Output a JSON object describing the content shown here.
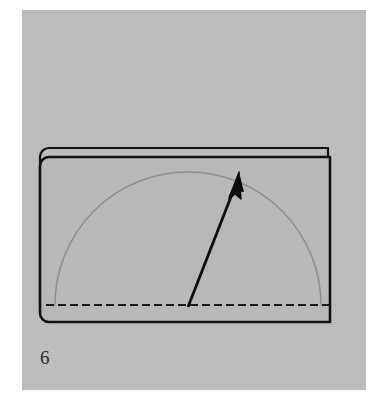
{
  "figure": {
    "step_number": "6",
    "caption": "",
    "panel_background_color": "#bdbdbd",
    "page_background_color": "#ffffff"
  },
  "colors": {
    "panel_gray": "#bdbdbd",
    "paper_fill": "#b8b8b8",
    "paper_fill_back": "#bcbcbc",
    "edge_black": "#111111",
    "fold_line_black": "#1a1a1a",
    "arc_gray": "#8f8f8f",
    "arrow_black": "#0d0d0d",
    "white_margin": "#ffffff"
  },
  "model": {
    "name": "folded-paper-two-layers",
    "back_layer": {
      "label": "back-layer",
      "x": 40,
      "y": 148,
      "width": 288,
      "height": 164,
      "corner_radius_top_left": 9,
      "corner_radius_bottom_left": 9,
      "stroke_width": 2.2
    },
    "front_layer": {
      "label": "front-layer",
      "x": 40,
      "y": 157,
      "width": 290,
      "height": 165,
      "corner_radius_top_left": 9,
      "corner_radius_bottom_left": 9,
      "stroke_width": 2.6
    }
  },
  "annotations": {
    "fold_line": {
      "label": "valley-fold-dashed-line",
      "type": "dashed",
      "x1": 46,
      "y1": 305,
      "x2": 330,
      "y2": 305,
      "dash_length": 8,
      "gap_length": 4,
      "stroke_width": 2.2
    },
    "sweep_arc": {
      "label": "fold-sweep-arc",
      "type": "semicircle",
      "center_x": 188,
      "center_y": 305,
      "radius_x": 133,
      "radius_y": 133,
      "stroke_width": 1.6
    },
    "arrow": {
      "label": "fold-direction-arrow",
      "tail_x": 188,
      "tail_y": 307,
      "tip_x": 239,
      "tip_y": 176,
      "shaft_width": 2.8,
      "head_length": 22,
      "head_width": 14
    }
  }
}
